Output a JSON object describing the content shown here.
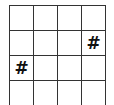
{
  "board": {
    "columns": 4,
    "rows": 4,
    "line_color": "#333333",
    "cells": [
      [
        "",
        "",
        "",
        ""
      ],
      [
        "",
        "",
        "",
        "#"
      ],
      [
        "#",
        "",
        "",
        ""
      ],
      [
        "",
        "",
        "",
        ""
      ]
    ]
  }
}
